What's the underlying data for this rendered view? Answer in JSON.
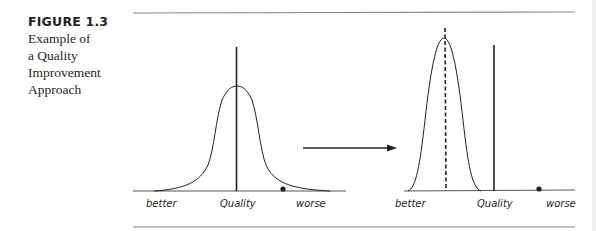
{
  "caption": {
    "figure_number": "FIGURE 1.3",
    "title_lines": [
      "Example of",
      "a Quality",
      "Improvement",
      "Approach"
    ]
  },
  "left_panel": {
    "labels": {
      "left": "better",
      "center": "Quality",
      "right": "worse"
    },
    "curve": "wide bell curve centered on quality line",
    "marker": "dot near worse side"
  },
  "right_panel": {
    "labels": {
      "left": "better",
      "center": "Quality",
      "right": "worse"
    },
    "curve": "narrow bell curve shifted toward better, dashed mean line",
    "marker": "dot near worse side"
  },
  "arrow": {
    "direction": "right"
  },
  "colors": {
    "ink": "#231f20",
    "rule": "#8a8a8a"
  }
}
